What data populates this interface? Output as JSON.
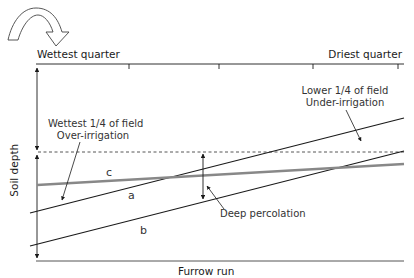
{
  "diagram": {
    "top_axis": {
      "left_label": "Wettest quarter",
      "right_label": "Driest quarter",
      "tick_count": 4
    },
    "y_axis_label": "Soil depth",
    "x_axis_label": "Furrow run",
    "lines": [
      {
        "id": "a",
        "label": "a",
        "color": "#1a1a1a",
        "description": "advance/infiltration line a"
      },
      {
        "id": "b",
        "label": "b",
        "color": "#1a1a1a",
        "description": "infiltration line b"
      },
      {
        "id": "c",
        "label": "c",
        "color": "#888888",
        "description": "root zone line c"
      }
    ],
    "annotations": {
      "wettest_line1": "Wettest 1/4 of field",
      "wettest_line2": "Over-irrigation",
      "lower_line1": "Lower 1/4 of field",
      "lower_line2": "Under-irrigation",
      "deep_percolation": "Deep percolation"
    },
    "colors": {
      "ink": "#1a1a1a",
      "gray_line": "#888888",
      "dashed": "#444444"
    }
  }
}
